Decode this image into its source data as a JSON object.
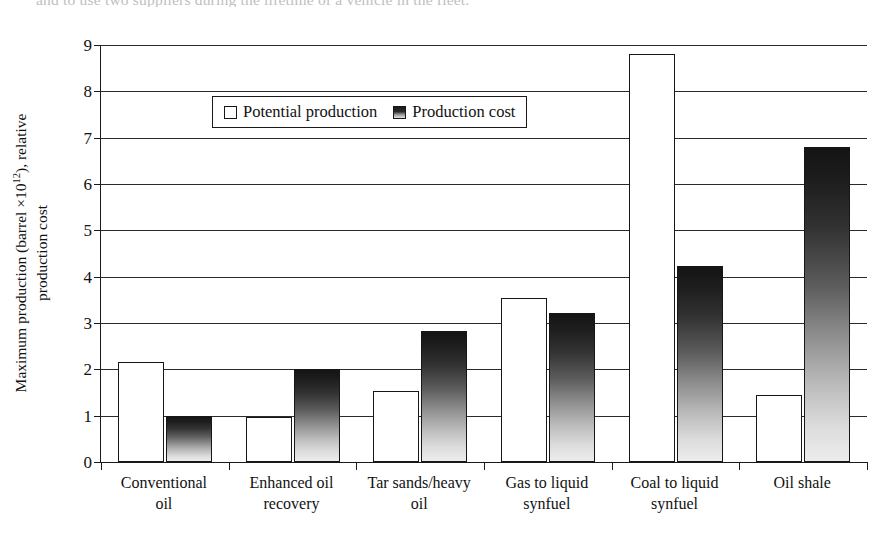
{
  "caption_sliver": "and to use two suppliers during the lifetime of a vehicle in the fleet.",
  "axes": {
    "ylabel_line1": "Maximum production (barrel ×10",
    "ylabel_exp": "12",
    "ylabel_line1b": "), relative",
    "ylabel_line2": "production cost",
    "yticks": [
      "0",
      "1",
      "2",
      "3",
      "4",
      "5",
      "6",
      "7",
      "8",
      "9"
    ],
    "ymin": 0,
    "ymax": 9
  },
  "legend": {
    "items": [
      {
        "label": "Potential production",
        "swatch": "white-square"
      },
      {
        "label": "Production cost",
        "swatch": "gradient-square"
      }
    ]
  },
  "xlabels": [
    {
      "line1": "Conventional",
      "line2": "oil"
    },
    {
      "line1": "Enhanced oil",
      "line2": "recovery"
    },
    {
      "line1": "Tar sands/heavy",
      "line2": "oil"
    },
    {
      "line1": "Gas to liquid",
      "line2": "synfuel"
    },
    {
      "line1": "Coal to liquid",
      "line2": "synfuel"
    },
    {
      "line1": "Oil shale",
      "line2": ""
    }
  ],
  "colors": {
    "axis": "#1a1a1a",
    "grid": "#2b2b2b",
    "potential_fill": "#ffffff",
    "cost_gradient_top": "#141414",
    "cost_gradient_bottom": "#ededed",
    "background": "#ffffff"
  },
  "chart_data": {
    "type": "bar",
    "title": "",
    "xlabel": "",
    "ylabel": "Maximum production (barrel ×10^12), relative production cost",
    "ylim": [
      0,
      9
    ],
    "yticks": [
      0,
      1,
      2,
      3,
      4,
      5,
      6,
      7,
      8,
      9
    ],
    "grid": true,
    "legend_position": "top-left-inside",
    "categories": [
      "Conventional oil",
      "Enhanced oil recovery",
      "Tar sands/heavy oil",
      "Gas to liquid synfuel",
      "Coal to liquid synfuel",
      "Oil shale"
    ],
    "series": [
      {
        "name": "Potential production",
        "values": [
          2.15,
          0.97,
          1.53,
          3.54,
          8.8,
          1.45
        ]
      },
      {
        "name": "Production cost",
        "values": [
          1.0,
          2.0,
          2.82,
          3.22,
          4.22,
          6.8
        ]
      }
    ]
  }
}
